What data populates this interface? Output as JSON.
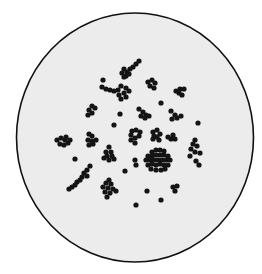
{
  "figure": {
    "background": "#ffffff",
    "dish": {
      "cx": 135,
      "cy": 137.5,
      "rx": 118.5,
      "ry": 124.5,
      "fill": "#ececec",
      "stroke": "#111111",
      "stroke_width": 1.6
    },
    "dot_color": "#141414",
    "dot_radius": 2.6,
    "clusters": [
      {
        "name": "top-chain",
        "dots": [
          [
            139,
            61
          ],
          [
            136,
            64
          ],
          [
            133,
            67
          ],
          [
            130,
            69
          ],
          [
            127,
            72
          ],
          [
            124,
            69
          ],
          [
            122,
            73
          ],
          [
            126,
            76
          ],
          [
            129,
            74
          ],
          [
            124,
            77
          ]
        ]
      },
      {
        "name": "top-left-arc",
        "dots": [
          [
            103,
            80
          ],
          [
            102,
            87
          ],
          [
            106,
            89
          ],
          [
            110,
            90
          ],
          [
            114,
            91
          ],
          [
            118,
            90
          ]
        ]
      },
      {
        "name": "upper-left-clump",
        "dots": [
          [
            121,
            86
          ],
          [
            126,
            88
          ],
          [
            124,
            93
          ],
          [
            119,
            95
          ],
          [
            121,
            99
          ],
          [
            126,
            97
          ],
          [
            129,
            91
          ]
        ]
      },
      {
        "name": "upper-mid",
        "dots": [
          [
            148,
            82
          ],
          [
            152,
            80
          ],
          [
            155,
            83
          ],
          [
            150,
            86
          ],
          [
            154,
            88
          ]
        ]
      },
      {
        "name": "upper-right",
        "dots": [
          [
            176,
            91
          ],
          [
            180,
            89
          ],
          [
            184,
            89
          ],
          [
            179,
            93
          ],
          [
            182,
            95
          ]
        ]
      },
      {
        "name": "single-1",
        "dots": [
          [
            161,
            103
          ]
        ]
      },
      {
        "name": "left-pair",
        "dots": [
          [
            92,
            106
          ],
          [
            95,
            108
          ],
          [
            89,
            110
          ],
          [
            92,
            113
          ],
          [
            88,
            115
          ]
        ]
      },
      {
        "name": "single-2",
        "dots": [
          [
            120,
            114
          ]
        ]
      },
      {
        "name": "mid-clump",
        "dots": [
          [
            139,
            109
          ],
          [
            143,
            112
          ],
          [
            141,
            116
          ],
          [
            146,
            115
          ],
          [
            145,
            118
          ],
          [
            149,
            116
          ]
        ]
      },
      {
        "name": "right-mid",
        "dots": [
          [
            171,
            111
          ],
          [
            175,
            115
          ],
          [
            172,
            119
          ],
          [
            177,
            118
          ],
          [
            181,
            116
          ]
        ]
      },
      {
        "name": "single-3",
        "dots": [
          [
            198,
            123
          ]
        ]
      },
      {
        "name": "single-4",
        "dots": [
          [
            114,
            125
          ]
        ]
      },
      {
        "name": "far-left",
        "dots": [
          [
            57,
            140
          ],
          [
            61,
            138
          ],
          [
            65,
            140
          ],
          [
            60,
            144
          ],
          [
            64,
            145
          ],
          [
            68,
            143
          ],
          [
            66,
            137
          ],
          [
            70,
            140
          ]
        ]
      },
      {
        "name": "left-column",
        "dots": [
          [
            89,
            134
          ],
          [
            92,
            136
          ],
          [
            88,
            140
          ],
          [
            92,
            141
          ],
          [
            89,
            145
          ],
          [
            93,
            144
          ],
          [
            96,
            140
          ]
        ]
      },
      {
        "name": "center-left",
        "dots": [
          [
            132,
            131
          ],
          [
            136,
            130
          ],
          [
            131,
            135
          ],
          [
            135,
            138
          ],
          [
            139,
            136
          ],
          [
            131,
            140
          ],
          [
            135,
            143
          ],
          [
            140,
            132
          ]
        ]
      },
      {
        "name": "center-x",
        "dots": [
          [
            153,
            132
          ],
          [
            157,
            130
          ],
          [
            154,
            136
          ],
          [
            157,
            137
          ],
          [
            160,
            134
          ],
          [
            153,
            139
          ],
          [
            159,
            140
          ]
        ]
      },
      {
        "name": "center-right-small",
        "dots": [
          [
            173,
            135
          ],
          [
            171,
            139
          ],
          [
            175,
            139
          ],
          [
            168,
            137
          ]
        ]
      },
      {
        "name": "right-vertical",
        "dots": [
          [
            195,
            140
          ],
          [
            193,
            144
          ],
          [
            197,
            146
          ],
          [
            191,
            149
          ],
          [
            195,
            152
          ],
          [
            190,
            156
          ],
          [
            200,
            153
          ],
          [
            196,
            161
          ],
          [
            199,
            165
          ]
        ]
      },
      {
        "name": "big-cluster",
        "dots": [
          [
            152,
            152
          ],
          [
            156,
            150
          ],
          [
            160,
            150
          ],
          [
            164,
            151
          ],
          [
            148,
            156
          ],
          [
            152,
            156
          ],
          [
            156,
            155
          ],
          [
            160,
            155
          ],
          [
            164,
            155
          ],
          [
            168,
            156
          ],
          [
            146,
            160
          ],
          [
            150,
            160
          ],
          [
            154,
            160
          ],
          [
            158,
            160
          ],
          [
            162,
            160
          ],
          [
            166,
            160
          ],
          [
            170,
            160
          ],
          [
            148,
            165
          ],
          [
            152,
            164
          ],
          [
            156,
            165
          ],
          [
            160,
            164
          ],
          [
            164,
            165
          ],
          [
            168,
            165
          ],
          [
            151,
            169
          ],
          [
            156,
            170
          ],
          [
            161,
            170
          ],
          [
            165,
            169
          ]
        ]
      },
      {
        "name": "left-mid-clump",
        "dots": [
          [
            109,
            147
          ],
          [
            106,
            152
          ],
          [
            111,
            152
          ],
          [
            107,
            156
          ],
          [
            112,
            156
          ],
          [
            109,
            160
          ],
          [
            114,
            159
          ],
          [
            104,
            158
          ]
        ]
      },
      {
        "name": "single-5",
        "dots": [
          [
            75,
            159
          ]
        ]
      },
      {
        "name": "mid-pair",
        "dots": [
          [
            135,
            160
          ],
          [
            136,
            165
          ]
        ]
      },
      {
        "name": "single-6",
        "dots": [
          [
            125,
            171
          ]
        ]
      },
      {
        "name": "diagonal-chain",
        "dots": [
          [
            90,
            166
          ],
          [
            87,
            170
          ],
          [
            84,
            173
          ],
          [
            87,
            176
          ],
          [
            82,
            177
          ],
          [
            80,
            180
          ],
          [
            77,
            182
          ],
          [
            75,
            185
          ],
          [
            72,
            187
          ],
          [
            69,
            189
          ]
        ]
      },
      {
        "name": "lower-left-clump",
        "dots": [
          [
            109,
            180
          ],
          [
            106,
            183
          ],
          [
            111,
            184
          ],
          [
            103,
            187
          ],
          [
            108,
            188
          ],
          [
            113,
            189
          ],
          [
            105,
            192
          ],
          [
            110,
            193
          ],
          [
            116,
            191
          ],
          [
            107,
            197
          ]
        ]
      },
      {
        "name": "single-7",
        "dots": [
          [
            147,
            191
          ]
        ]
      },
      {
        "name": "lower-right-pair",
        "dots": [
          [
            173,
            187
          ],
          [
            177,
            186
          ],
          [
            175,
            191
          ]
        ]
      },
      {
        "name": "single-8",
        "dots": [
          [
            161,
            200
          ]
        ]
      },
      {
        "name": "single-9",
        "dots": [
          [
            136,
            205
          ]
        ]
      }
    ]
  }
}
